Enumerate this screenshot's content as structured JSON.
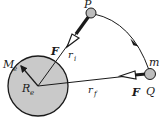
{
  "diagram": {
    "type": "orbital-transfer",
    "colors": {
      "earth_fill": "#c9c9c9",
      "mass_fill": "#bdbdbd",
      "line": "#1a1a1a",
      "background": "#ffffff"
    },
    "earth": {
      "mass_label": "M",
      "mass_sub": "e",
      "radius_label": "R",
      "radius_sub": "e"
    },
    "points": {
      "P": {
        "label": "P"
      },
      "Q": {
        "label": "Q",
        "mass_label": "m"
      }
    },
    "radii": {
      "initial": {
        "label": "r",
        "sub": "i"
      },
      "final": {
        "label": "r",
        "sub": "f"
      }
    },
    "forces": [
      {
        "at": "P",
        "label": "F"
      },
      {
        "at": "Q",
        "label": "F"
      }
    ]
  }
}
